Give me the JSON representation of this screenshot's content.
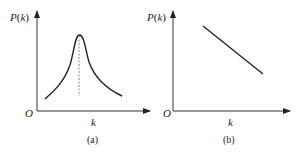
{
  "panels": [
    {
      "id": "a",
      "caption": "(a)",
      "y_label": "P(k)",
      "y_label_func": "P",
      "y_label_arg": "k",
      "x_label": "k",
      "origin": "O",
      "curve": "peaked (bell-shaped) distribution with dashed line marking the peak"
    },
    {
      "id": "b",
      "caption": "(b)",
      "y_label": "P(k)",
      "y_label_func": "P",
      "y_label_arg": "k",
      "x_label": "k",
      "origin": "O",
      "curve": "straight decreasing line"
    }
  ],
  "colors": {
    "line": "#222222",
    "dashed": "#888888",
    "background": "#ffffff"
  }
}
